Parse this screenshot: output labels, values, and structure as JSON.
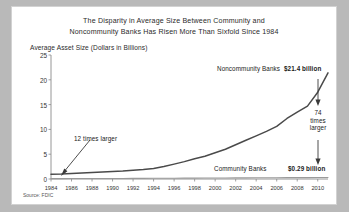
{
  "chart_data": {
    "type": "line",
    "title": "The Disparity in Average Size Between Community and Noncommunity Banks Has Risen More Than Sixfold Since 1984",
    "title_line1": "The Disparity in Average Size Between Community and",
    "title_line2": "Noncommunity Banks Has Risen More Than Sixfold Since 1984",
    "ylabel": "Average Asset Size (Dollars in Billions)",
    "xlabel": "",
    "ylim": [
      0,
      25
    ],
    "yticks": [
      0,
      5,
      10,
      15,
      20,
      25
    ],
    "xlim": [
      1984,
      2011
    ],
    "xticks": [
      1984,
      1986,
      1988,
      1990,
      1992,
      1994,
      1996,
      1998,
      2000,
      2002,
      2004,
      2006,
      2008,
      2010
    ],
    "grid": false,
    "legend": "inline-annotations",
    "source": "Source: FDIC",
    "x": [
      1984,
      1985,
      1986,
      1987,
      1988,
      1989,
      1990,
      1991,
      1992,
      1993,
      1994,
      1995,
      1996,
      1997,
      1998,
      1999,
      2000,
      2001,
      2002,
      2003,
      2004,
      2005,
      2006,
      2007,
      2008,
      2009,
      2010,
      2011
    ],
    "series": [
      {
        "name": "Noncommunity Banks",
        "values": [
          0.95,
          1.0,
          1.1,
          1.2,
          1.3,
          1.4,
          1.5,
          1.6,
          1.75,
          1.9,
          2.1,
          2.5,
          3.0,
          3.5,
          4.1,
          4.6,
          5.3,
          6.0,
          6.9,
          7.8,
          8.7,
          9.6,
          10.6,
          12.2,
          13.5,
          14.7,
          17.5,
          21.4
        ],
        "end_value": 21.4,
        "end_label": "$21.4 billion"
      },
      {
        "name": "Community Banks",
        "values": [
          0.08,
          0.08,
          0.09,
          0.09,
          0.1,
          0.1,
          0.11,
          0.11,
          0.12,
          0.13,
          0.14,
          0.15,
          0.16,
          0.17,
          0.18,
          0.19,
          0.2,
          0.21,
          0.22,
          0.23,
          0.24,
          0.25,
          0.26,
          0.27,
          0.28,
          0.28,
          0.29,
          0.29
        ],
        "end_value": 0.29,
        "end_label": "$0.29 billion"
      }
    ],
    "annotations": [
      {
        "text": "12 times larger",
        "ref_year": 1984
      },
      {
        "text": "74 times larger",
        "text_lines": [
          "74",
          "times",
          "larger"
        ],
        "ref_year": 2011
      },
      {
        "text": "Noncommunity Banks"
      },
      {
        "text": "Community Banks"
      }
    ]
  }
}
